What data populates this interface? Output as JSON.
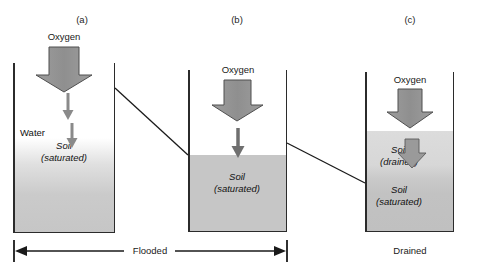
{
  "figure": {
    "colors": {
      "soil": "#c6c6c6",
      "soil_drained": "#dcdcdc",
      "arrow_fill": "#9a9a9a",
      "arrow_stroke": "#4a4a4a",
      "line": "#2b2b2b",
      "background": "#ffffff"
    }
  },
  "panels": [
    {
      "id": "a",
      "label": "(a)",
      "oxygen_label": "Oxygen",
      "water_label": "Water",
      "soil_label_line1": "Soil",
      "soil_label_line2": "(saturated)",
      "condition": "Flooded"
    },
    {
      "id": "b",
      "label": "(b)",
      "oxygen_label": "Oxygen",
      "soil_label_line1": "Soil",
      "soil_label_line2": "(saturated)",
      "condition": "Flooded"
    },
    {
      "id": "c",
      "label": "(c)",
      "oxygen_label": "Oxygen",
      "soil_drained_line1": "Soil",
      "soil_drained_line2": "(drained)",
      "soil_sat_line1": "Soil",
      "soil_sat_line2": "(saturated)",
      "condition": "Drained"
    }
  ],
  "captions": {
    "flooded": "Flooded",
    "drained": "Drained"
  }
}
